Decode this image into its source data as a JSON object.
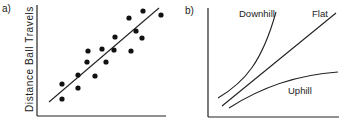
{
  "chart_data": [
    {
      "panel_label": "a)",
      "type": "scatter",
      "title": "",
      "xlabel": "",
      "ylabel": "Distance Ball Travels",
      "grid": false,
      "legend": null,
      "points": [
        {
          "x": 62,
          "y": 84
        },
        {
          "x": 62,
          "y": 99
        },
        {
          "x": 78,
          "y": 75
        },
        {
          "x": 78,
          "y": 88
        },
        {
          "x": 87,
          "y": 62
        },
        {
          "x": 88,
          "y": 51
        },
        {
          "x": 95,
          "y": 76
        },
        {
          "x": 102,
          "y": 49
        },
        {
          "x": 106,
          "y": 62
        },
        {
          "x": 114,
          "y": 50
        },
        {
          "x": 115,
          "y": 37
        },
        {
          "x": 129,
          "y": 18
        },
        {
          "x": 131,
          "y": 51
        },
        {
          "x": 136,
          "y": 31
        },
        {
          "x": 142,
          "y": 38
        },
        {
          "x": 143,
          "y": 11
        },
        {
          "x": 161,
          "y": 15
        }
      ],
      "fit_line": {
        "x1": 49,
        "y1": 102,
        "x2": 159,
        "y2": 8
      },
      "notes": "Positive linear relationship; no tick labels shown"
    },
    {
      "panel_label": "b)",
      "type": "line",
      "title": "",
      "xlabel": "",
      "ylabel": "",
      "grid": false,
      "series": [
        {
          "name": "Downhill",
          "shape": "convex, steep rising"
        },
        {
          "name": "Flat",
          "shape": "linear rising"
        },
        {
          "name": "Uphill",
          "shape": "concave, flattening"
        }
      ],
      "notes": "Three curves labeled directly; no tick labels shown"
    }
  ],
  "panels": {
    "a": {
      "label": "a)",
      "ylabel": "Distance Ball Travels"
    },
    "b": {
      "label": "b)",
      "curves": {
        "downhill": "Downhill",
        "flat": "Flat",
        "uphill": "Uphill"
      }
    }
  },
  "colors": {
    "ink": "#222222",
    "background": "#ffffff"
  }
}
